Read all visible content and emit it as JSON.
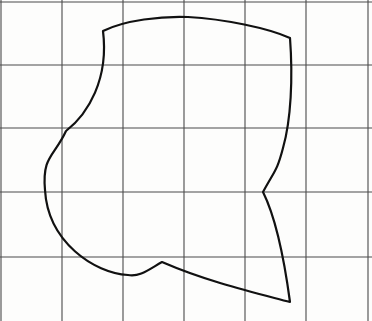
{
  "figure": {
    "kind": "line-drawing",
    "width": 372,
    "height": 321,
    "background_color": "#fdfdfc",
    "grid": {
      "line_color": "#4a4a4a",
      "line_width": 1.1,
      "vertical_lines_x": [
        1,
        62,
        123,
        184,
        245,
        306,
        368
      ],
      "horizontal_lines_y": [
        2,
        65,
        128,
        192,
        257
      ],
      "columns": 6,
      "rows": 4,
      "cell_width": 61,
      "cell_height": 63
    },
    "curve": {
      "stroke_color": "#111111",
      "stroke_width": 2.2,
      "fill": "none",
      "closed": true,
      "cusp_points": [
        {
          "name": "top-left-cusp",
          "x": 103,
          "y": 31
        },
        {
          "name": "top-right-corner",
          "x": 290,
          "y": 38
        },
        {
          "name": "right-notch-cusp",
          "x": 263,
          "y": 192
        },
        {
          "name": "bottom-right-corner",
          "x": 290,
          "y": 302
        },
        {
          "name": "bottom-peak-cusp",
          "x": 162,
          "y": 262
        }
      ],
      "extreme_points": [
        {
          "name": "top-apex",
          "x": 188,
          "y": 17
        },
        {
          "name": "left-extreme",
          "x": 45,
          "y": 190
        },
        {
          "name": "left-inflection",
          "x": 66,
          "y": 131
        },
        {
          "name": "bottom-dip",
          "x": 128,
          "y": 275
        }
      ],
      "path": "M 103 31 C 128 20 160 16 188 17 C 222 19 262 26 290 38 C 291 70 290 108 283 141 C 277 165 271 180 263 192 C 258 180 252 168 246 160 C 240 152 231 146 222 142 M 0 0"
    }
  }
}
